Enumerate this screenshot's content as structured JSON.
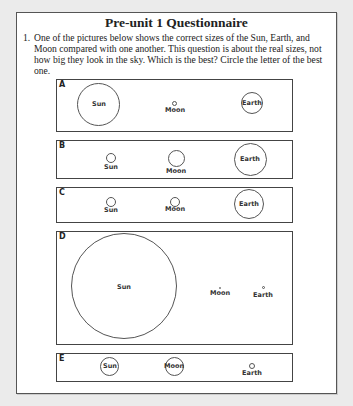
{
  "document": {
    "title": "Pre-unit 1 Questionnaire",
    "question_number": "1.",
    "question_text": "One of the pictures below shows the correct sizes of the Sun, Earth, and Moon compared with one another. This question is about the real sizes, not how big they look in the sky. Which is the best? Circle the letter of the best one."
  },
  "options": [
    {
      "letter": "A",
      "bodies": [
        {
          "name": "Sun",
          "size": "large",
          "label_inside": true
        },
        {
          "name": "Moon",
          "size": "tiny",
          "label_inside": false
        },
        {
          "name": "Earth",
          "size": "medium",
          "label_inside": true
        }
      ]
    },
    {
      "letter": "B",
      "bodies": [
        {
          "name": "Sun",
          "size": "small",
          "label_inside": false
        },
        {
          "name": "Moon",
          "size": "medium",
          "label_inside": false
        },
        {
          "name": "Earth",
          "size": "large",
          "label_inside": true
        }
      ]
    },
    {
      "letter": "C",
      "bodies": [
        {
          "name": "Sun",
          "size": "small",
          "label_inside": false
        },
        {
          "name": "Moon",
          "size": "small",
          "label_inside": false
        },
        {
          "name": "Earth",
          "size": "large",
          "label_inside": true
        }
      ]
    },
    {
      "letter": "D",
      "bodies": [
        {
          "name": "Sun",
          "size": "huge",
          "label_inside": true
        },
        {
          "name": "Moon",
          "size": "dot",
          "label_inside": false
        },
        {
          "name": "Earth",
          "size": "tiny",
          "label_inside": false
        }
      ]
    },
    {
      "letter": "E",
      "bodies": [
        {
          "name": "Sun",
          "size": "medium",
          "label_inside": true
        },
        {
          "name": "Moon",
          "size": "medium",
          "label_inside": true
        },
        {
          "name": "Earth",
          "size": "small",
          "label_inside": false
        }
      ]
    }
  ]
}
